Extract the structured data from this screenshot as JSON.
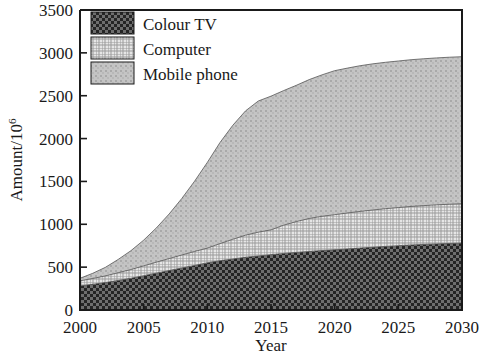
{
  "chart_data": {
    "type": "area",
    "stacked": true,
    "title": "",
    "xlabel": "Year",
    "ylabel": "Amount/10^6",
    "ylabel_base": "Amount/10",
    "ylabel_exponent": "6",
    "xlim": [
      2000,
      2030
    ],
    "ylim": [
      0,
      3500
    ],
    "xticks": [
      2000,
      2005,
      2010,
      2015,
      2020,
      2025,
      2030
    ],
    "xtick_labels": [
      "2000",
      "2005",
      "2010",
      "2015",
      "2020",
      "2025",
      "2030"
    ],
    "yticks": [
      0,
      500,
      1000,
      1500,
      2000,
      2500,
      3000,
      3500
    ],
    "ytick_labels": [
      "0",
      "500",
      "1000",
      "1500",
      "2000",
      "2500",
      "3000",
      "3500"
    ],
    "grid": false,
    "legend_position": "top-left",
    "x": [
      2000,
      2001,
      2002,
      2003,
      2004,
      2005,
      2006,
      2007,
      2008,
      2009,
      2010,
      2011,
      2012,
      2013,
      2014,
      2015,
      2016,
      2017,
      2018,
      2019,
      2020,
      2021,
      2022,
      2023,
      2024,
      2025,
      2026,
      2027,
      2028,
      2029,
      2030
    ],
    "series": [
      {
        "name": "Colour TV",
        "fill_color": "#4a4a4a",
        "pattern": "checker-dark",
        "values": [
          280,
          300,
          320,
          345,
          370,
          400,
          430,
          460,
          490,
          520,
          550,
          575,
          595,
          615,
          630,
          645,
          660,
          672,
          683,
          693,
          702,
          712,
          722,
          732,
          742,
          750,
          758,
          765,
          771,
          776,
          780
        ]
      },
      {
        "name": "Computer",
        "fill_color": "#c8c8c8",
        "pattern": "grid-light",
        "values": [
          60,
          68,
          78,
          90,
          102,
          115,
          128,
          140,
          152,
          163,
          172,
          200,
          230,
          258,
          278,
          290,
          330,
          360,
          385,
          400,
          410,
          420,
          428,
          435,
          440,
          445,
          450,
          453,
          456,
          458,
          460
        ]
      },
      {
        "name": "Mobile phone",
        "fill_color": "#bdbdbd",
        "pattern": "dots-light",
        "values": [
          30,
          60,
          100,
          155,
          220,
          300,
          400,
          520,
          660,
          820,
          1000,
          1180,
          1330,
          1450,
          1530,
          1560,
          1570,
          1590,
          1620,
          1650,
          1680,
          1690,
          1700,
          1705,
          1708,
          1710,
          1712,
          1713,
          1714,
          1715,
          1715
        ]
      }
    ],
    "cumulative_totals": [
      370,
      428,
      498,
      590,
      692,
      815,
      958,
      1120,
      1302,
      1503,
      1722,
      1955,
      2155,
      2323,
      2438,
      2495,
      2560,
      2622,
      2688,
      2743,
      2792,
      2822,
      2850,
      2872,
      2890,
      2905,
      2920,
      2931,
      2941,
      2949,
      2955
    ]
  },
  "legend": {
    "items": [
      {
        "label": "Colour TV"
      },
      {
        "label": "Computer"
      },
      {
        "label": "Mobile phone"
      }
    ]
  }
}
